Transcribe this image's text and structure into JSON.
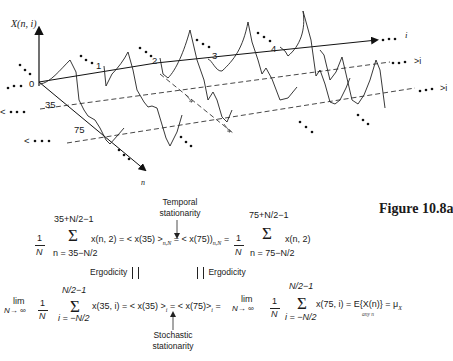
{
  "figure": {
    "caption": "Figure 10.8a",
    "axis_vertical_label": "X(n, i)",
    "axis_i_label": "i",
    "axis_n_label": "n",
    "origin_label": "0",
    "n_marks": [
      "35",
      "75"
    ],
    "realization_labels": [
      "1",
      "2",
      "3",
      "4"
    ],
    "dashed_line_labels": [
      ">i",
      ">i"
    ],
    "left_markers": [
      "<",
      "<"
    ],
    "ellipsis": "• • •",
    "crossing_marks": [
      "2",
      "2"
    ]
  },
  "equation_temporal": {
    "frac_num": "1",
    "frac_den": "N",
    "sum_upper_left": "35+N/2−1",
    "sum_lower_left": "n = 35−N/2",
    "summand_left": "x(n, 2) = < x(35) >",
    "sub_left": "n,N",
    "middle": "= < x(75)",
    "sub_middle": "n,N",
    "eq_sign": "=",
    "sum_upper_right": "75+N/2−1",
    "sum_lower_right": "n = 75−N/2",
    "summand_right": "x(n, 2)",
    "annotation_line1": "Temporal",
    "annotation_line2": "stationarity"
  },
  "ergodicity": {
    "left_label": "Ergodicity",
    "right_label": "Ergodicity"
  },
  "equation_stochastic": {
    "lim_label": "lim",
    "lim_sub": "N→ ∞",
    "frac_num": "1",
    "frac_den": "N",
    "sum_upper": "N/2−1",
    "sum_lower": "i = −N/2",
    "summand_left": "x(35, i) = < x(35) >",
    "sub_i": "i",
    "eq_center": "=",
    "middle": "< x(75)>",
    "eq_right": "=",
    "summand_right": "x(75, i) = E{X(n)} = μ",
    "mu_sub": "X",
    "any_n": "any n",
    "annotation_line1": "Stochastic",
    "annotation_line2": "stationarity"
  }
}
